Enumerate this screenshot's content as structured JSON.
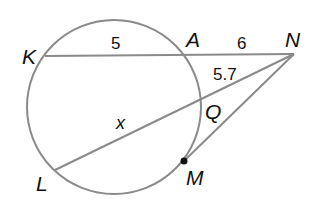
{
  "diagram": {
    "type": "circle-secants-tangent",
    "circle": {
      "cx": 114,
      "cy": 107,
      "r": 87
    },
    "colors": {
      "line": "#8a8a8a",
      "text": "#111111",
      "background": "#ffffff"
    },
    "points": {
      "K": {
        "label": "K",
        "x": 45,
        "y": 56
      },
      "A": {
        "label": "A",
        "x": 184,
        "y": 55
      },
      "N": {
        "label": "N",
        "x": 294,
        "y": 54
      },
      "Q": {
        "label": "Q",
        "x": 200,
        "y": 98
      },
      "L": {
        "label": "L",
        "x": 55,
        "y": 170
      },
      "M": {
        "label": "M",
        "x": 184,
        "y": 161
      }
    },
    "segments": [
      {
        "from": "K",
        "to": "N",
        "name": "secant-KN"
      },
      {
        "from": "L",
        "to": "N",
        "name": "secant-LN"
      },
      {
        "from": "M",
        "to": "N",
        "name": "tangent-MN"
      }
    ],
    "lengths": {
      "KA": "5",
      "AN": "6",
      "QN": "5.7",
      "LQ": "x"
    }
  }
}
